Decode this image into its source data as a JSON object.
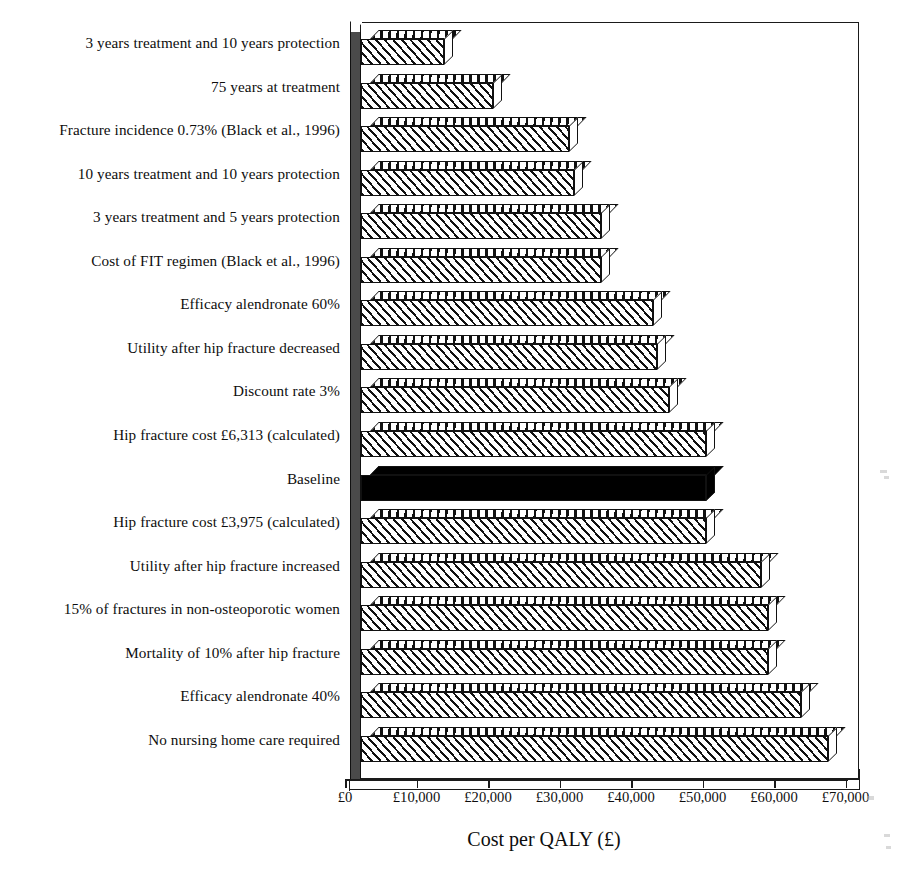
{
  "chart_data": {
    "type": "bar",
    "orientation": "horizontal",
    "title": "",
    "xlabel": "Cost per QALY (£)",
    "ylabel": "",
    "xlim": [
      0,
      70000
    ],
    "xtick_labels": [
      "£0",
      "£10,000",
      "£20,000",
      "£30,000",
      "£40,000",
      "£50,000",
      "£60,000",
      "£70,000"
    ],
    "xtick_values": [
      0,
      10000,
      20000,
      30000,
      40000,
      50000,
      60000,
      70000
    ],
    "grid": false,
    "legend": false,
    "categories": [
      "3 years treatment and 10 years protection",
      "75 years at treatment",
      "Fracture incidence 0.73% (Black et al., 1996)",
      "10 years treatment and 10 years protection",
      "3 years treatment and 5 years protection",
      "Cost of FIT regimen (Black et al., 1996)",
      "Efficacy alendronate 60%",
      "Utility after hip fracture decreased",
      "Discount rate 3%",
      "Hip fracture cost £6,313 (calculated)",
      "Baseline",
      "Hip fracture cost £3,975 (calculated)",
      "Utility after hip fracture increased",
      "15% of fractures in non-osteoporotic women",
      "Mortality of 10% after hip fracture",
      "Efficacy alendronate 40%",
      "No nursing home care required"
    ],
    "values": [
      11600,
      18500,
      29100,
      29800,
      33600,
      33600,
      40800,
      41400,
      43100,
      48300,
      48300,
      48300,
      55900,
      56900,
      56900,
      61500,
      65300
    ],
    "highlight_index": 10,
    "highlight_style": "solid-black",
    "bar_style": "diagonal-hatch-3d",
    "colors": {
      "bar_fill": "#ffffff",
      "bar_hatch": "#111111",
      "bar_outline": "#111111",
      "baseline_fill": "#000000",
      "axis": "#1a1a1a",
      "side_wall": "#4a4a4a",
      "text": "#0d0d0d"
    }
  }
}
